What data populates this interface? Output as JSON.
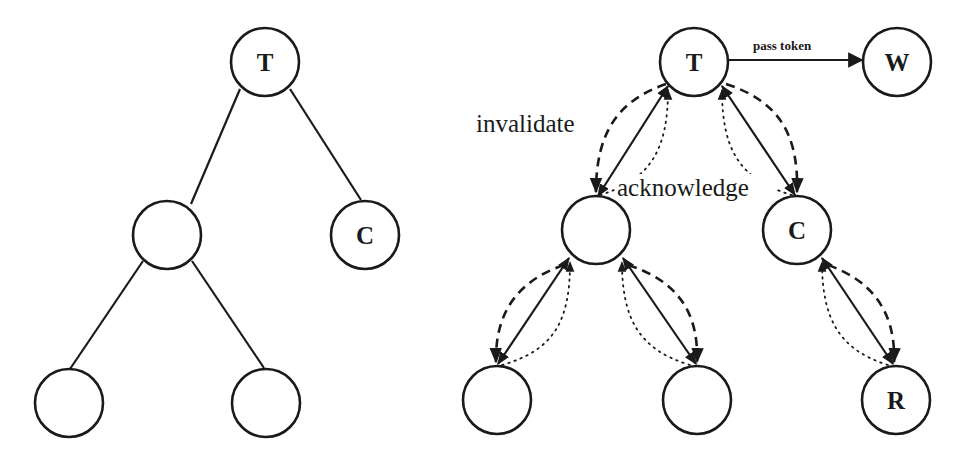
{
  "diagram": {
    "type": "token-tree-invalidation",
    "panels": [
      {
        "id": "left",
        "title": "",
        "nodes": [
          {
            "id": "L_T",
            "label": "T",
            "x": 265,
            "y": 62
          },
          {
            "id": "L_M",
            "label": "",
            "x": 167,
            "y": 235
          },
          {
            "id": "L_C",
            "label": "C",
            "x": 365,
            "y": 235
          },
          {
            "id": "L_LL",
            "label": "",
            "x": 69,
            "y": 403
          },
          {
            "id": "L_LR",
            "label": "",
            "x": 266,
            "y": 403
          }
        ],
        "edges": [
          {
            "from": "L_T",
            "to": "L_M",
            "style": "solid"
          },
          {
            "from": "L_T",
            "to": "L_C",
            "style": "solid"
          },
          {
            "from": "L_M",
            "to": "L_LL",
            "style": "solid"
          },
          {
            "from": "L_M",
            "to": "L_LR",
            "style": "solid"
          }
        ]
      },
      {
        "id": "right",
        "title": "",
        "nodes": [
          {
            "id": "R_T",
            "label": "T",
            "x": 694,
            "y": 62
          },
          {
            "id": "R_W",
            "label": "W",
            "x": 897,
            "y": 62
          },
          {
            "id": "R_M",
            "label": "",
            "x": 596,
            "y": 230
          },
          {
            "id": "R_C",
            "label": "C",
            "x": 797,
            "y": 230
          },
          {
            "id": "R_LL",
            "label": "",
            "x": 497,
            "y": 400
          },
          {
            "id": "R_LR",
            "label": "",
            "x": 697,
            "y": 400
          },
          {
            "id": "R_R",
            "label": "R",
            "x": 896,
            "y": 400
          }
        ],
        "edges": [
          {
            "from": "R_T",
            "to": "R_W",
            "style": "solid-arrow",
            "label": "pass token"
          },
          {
            "from": "R_T",
            "to": "R_M",
            "style": "bidirectional"
          },
          {
            "from": "R_T",
            "to": "R_C",
            "style": "bidirectional"
          },
          {
            "from": "R_M",
            "to": "R_LL",
            "style": "bidirectional"
          },
          {
            "from": "R_M",
            "to": "R_LR",
            "style": "bidirectional"
          },
          {
            "from": "R_C",
            "to": "R_R",
            "style": "bidirectional"
          }
        ]
      }
    ],
    "labels": {
      "invalidate": "invalidate",
      "acknowledge": "acknowledge",
      "pass_token": "pass token"
    },
    "node_labels": {
      "left_root": "T",
      "left_c": "C",
      "right_root": "T",
      "right_w": "W",
      "right_c": "C",
      "right_r": "R"
    },
    "legend": {
      "solid": "tree link",
      "dashed": "invalidate",
      "dotted": "acknowledge"
    },
    "colors": {
      "stroke": "#1a1a1a",
      "background": "#ffffff"
    }
  }
}
